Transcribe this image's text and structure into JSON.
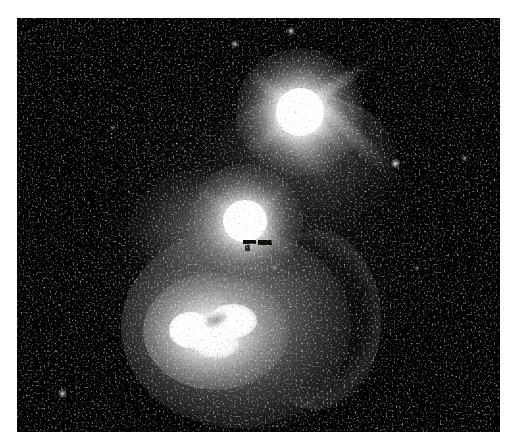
{
  "page": {
    "width": 514,
    "height": 443,
    "background_color": "#ffffff"
  },
  "image_field": {
    "name": "astronomical-image",
    "left": 17,
    "top": 18,
    "width": 483,
    "height": 414,
    "background_color": "#050505",
    "colormap": "grayscale",
    "border_color": "#ffffff"
  },
  "chart_data": {
    "type": "heatmap",
    "title": "",
    "xlabel": "",
    "ylabel": "",
    "colormap": "grayscale",
    "grid": false,
    "legend": "none",
    "xlim": [
      0,
      483
    ],
    "ylim": [
      0,
      414
    ],
    "features": [
      {
        "id": "upper-nucleus",
        "label": "Upper bright nucleus",
        "cx": 283,
        "cy": 94,
        "core_radius": 26,
        "halo_radius": 62,
        "peak_level": 255,
        "has_diffraction_spikes": true
      },
      {
        "id": "middle-nucleus",
        "label": "Central bright nucleus",
        "cx": 228,
        "cy": 204,
        "core_radius": 22,
        "halo_radius": 52,
        "peak_level": 255,
        "has_diffraction_spikes": true
      },
      {
        "id": "lower-knot",
        "label": "Lower-left bright knot",
        "cx": 188,
        "cy": 314,
        "core_radius": 30,
        "halo_radius": 58,
        "peak_level": 248,
        "has_diffraction_spikes": false
      },
      {
        "id": "southern-halo",
        "label": "Southern diffuse halo",
        "cx": 222,
        "cy": 312,
        "rx": 112,
        "ry": 96,
        "peak_level": 132
      },
      {
        "id": "bridge",
        "label": "Emission bridge between nuclei",
        "x1": 275,
        "y1": 110,
        "x2": 232,
        "y2": 200,
        "peak_level": 150
      },
      {
        "id": "south-east-streak",
        "label": "South-east linear streak",
        "x1": 300,
        "y1": 108,
        "x2": 372,
        "y2": 186,
        "peak_level": 160
      },
      {
        "id": "dark-notch",
        "label": "Dark absorption notch below central nucleus",
        "cx": 238,
        "cy": 224,
        "width": 26,
        "height": 5,
        "level": 18
      }
    ],
    "point_sources": [
      {
        "label": "star-1",
        "x": 378,
        "y": 145,
        "brightness": 205
      },
      {
        "label": "star-2",
        "x": 45,
        "y": 375,
        "brightness": 190
      },
      {
        "label": "star-3",
        "x": 217,
        "y": 25,
        "brightness": 175
      },
      {
        "label": "star-4",
        "x": 273,
        "y": 12,
        "brightness": 200
      },
      {
        "label": "star-5",
        "x": 447,
        "y": 140,
        "brightness": 150
      },
      {
        "label": "star-6",
        "x": 257,
        "y": 249,
        "brightness": 145
      },
      {
        "label": "star-7",
        "x": 400,
        "y": 250,
        "brightness": 130
      },
      {
        "label": "star-8",
        "x": 96,
        "y": 110,
        "brightness": 125
      }
    ],
    "background": {
      "mean_level": 12,
      "noise_sigma": 16,
      "description": "Pixelated salt-and-pepper detector noise"
    }
  }
}
